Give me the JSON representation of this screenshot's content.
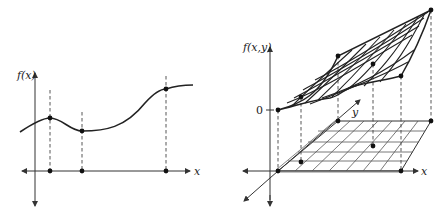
{
  "left_plot": {
    "y_axis_label": "f(x)",
    "x_axis_label": "x",
    "sample_points": [
      {
        "x": 50,
        "fx": 118
      },
      {
        "x": 82,
        "fx": 131
      },
      {
        "x": 166,
        "fx": 89
      }
    ]
  },
  "right_plot": {
    "y_axis_label": "f(x,y)",
    "x_axis_label": "x",
    "depth_axis_label": "y",
    "zero_tick_label": "0",
    "colors": {
      "ink": "#222222",
      "background": "#ffffff"
    }
  }
}
